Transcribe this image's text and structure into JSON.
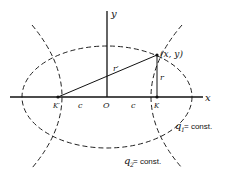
{
  "diagram": {
    "axes": {
      "x_label": "x",
      "y_label": "y"
    },
    "origin_label": "O",
    "point_label": "(x, y)",
    "focus_left_label": "K′",
    "focus_right_label": "K",
    "c_left_label": "c",
    "c_right_label": "c",
    "r_label": "r",
    "r_prime_label": "r′",
    "q1": {
      "symbol": "q",
      "sub": "1",
      "text": " = const."
    },
    "q2": {
      "symbol": "q",
      "sub": "2",
      "text": " = const."
    }
  }
}
